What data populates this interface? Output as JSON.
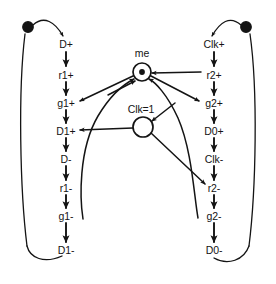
{
  "diagram": {
    "type": "signal-transition-graph",
    "title": "",
    "background_color": "#ffffff",
    "stroke_color": "#141414",
    "text_color": "#141414"
  },
  "places": [
    {
      "id": "me",
      "label": "me",
      "marked": true,
      "tokens": 1,
      "cx": 142,
      "cy": 72,
      "r": 9,
      "label_x": 142,
      "label_y": 53
    },
    {
      "id": "clk1",
      "label": "Clk=1",
      "marked": false,
      "tokens": 0,
      "cx": 143,
      "cy": 127,
      "r": 10,
      "label_x": 141,
      "label_y": 109
    },
    {
      "id": "p-left-init",
      "label": "",
      "marked": true,
      "tokens": 1,
      "cx": 28,
      "cy": 27,
      "r": 5.2,
      "label_x": 28,
      "label_y": 27
    },
    {
      "id": "p-right-init",
      "label": "",
      "marked": true,
      "tokens": 1,
      "cx": 246,
      "cy": 27,
      "r": 5.2,
      "label_x": 246,
      "label_y": 27
    }
  ],
  "transitions": {
    "left_column": [
      {
        "id": "d-plus",
        "label": "D+",
        "x": 66,
        "y": 44
      },
      {
        "id": "r1-plus",
        "label": "r1+",
        "x": 66,
        "y": 75
      },
      {
        "id": "g1-plus",
        "label": "g1+",
        "x": 66,
        "y": 103
      },
      {
        "id": "d1-plus",
        "label": "D1+",
        "x": 66,
        "y": 131
      },
      {
        "id": "d-minus",
        "label": "D-",
        "x": 66,
        "y": 159
      },
      {
        "id": "r1-minus",
        "label": "r1-",
        "x": 66,
        "y": 188
      },
      {
        "id": "g1-minus",
        "label": "g1-",
        "x": 66,
        "y": 216
      },
      {
        "id": "d1-minus",
        "label": "D1-",
        "x": 66,
        "y": 250
      }
    ],
    "right_column": [
      {
        "id": "clk-plus",
        "label": "Clk+",
        "x": 214,
        "y": 44
      },
      {
        "id": "r2-plus",
        "label": "r2+",
        "x": 214,
        "y": 75
      },
      {
        "id": "g2-plus",
        "label": "g2+",
        "x": 214,
        "y": 103
      },
      {
        "id": "d0-plus",
        "label": "D0+",
        "x": 214,
        "y": 131
      },
      {
        "id": "clk-minus",
        "label": "Clk-",
        "x": 214,
        "y": 159
      },
      {
        "id": "r2-minus",
        "label": "r2-",
        "x": 214,
        "y": 188
      },
      {
        "id": "g2-minus",
        "label": "g2-",
        "x": 214,
        "y": 216
      },
      {
        "id": "d0-minus",
        "label": "D0-",
        "x": 214,
        "y": 250
      }
    ]
  },
  "arcs": [
    {
      "id": "arc-init-l-to-dplus",
      "from": "p-left-init",
      "to": "d-plus"
    },
    {
      "id": "arc-dplus-r1plus",
      "from": "d-plus",
      "to": "r1-plus"
    },
    {
      "id": "arc-r1plus-g1plus",
      "from": "r1-plus",
      "to": "g1-plus"
    },
    {
      "id": "arc-g1plus-d1plus",
      "from": "g1-plus",
      "to": "d1-plus"
    },
    {
      "id": "arc-d1plus-dminus",
      "from": "d1-plus",
      "to": "d-minus"
    },
    {
      "id": "arc-dminus-r1minus",
      "from": "d-minus",
      "to": "r1-minus"
    },
    {
      "id": "arc-r1minus-g1minus",
      "from": "r1-minus",
      "to": "g1-minus"
    },
    {
      "id": "arc-g1minus-d1minus",
      "from": "g1-minus",
      "to": "d1-minus"
    },
    {
      "id": "arc-d1minus-init-l",
      "from": "d1-minus",
      "to": "p-left-init"
    },
    {
      "id": "arc-init-r-to-clkplus",
      "from": "p-right-init",
      "to": "clk-plus"
    },
    {
      "id": "arc-clkplus-r2plus",
      "from": "clk-plus",
      "to": "r2-plus"
    },
    {
      "id": "arc-r2plus-g2plus",
      "from": "r2-plus",
      "to": "g2-plus"
    },
    {
      "id": "arc-g2plus-d0plus",
      "from": "g2-plus",
      "to": "d0-plus"
    },
    {
      "id": "arc-d0plus-clkminus",
      "from": "d0-plus",
      "to": "clk-minus"
    },
    {
      "id": "arc-clkminus-r2minus",
      "from": "clk-minus",
      "to": "r2-minus"
    },
    {
      "id": "arc-r2minus-g2minus",
      "from": "r2-minus",
      "to": "g2-minus"
    },
    {
      "id": "arc-g2minus-d0minus",
      "from": "g2-minus",
      "to": "d0-minus"
    },
    {
      "id": "arc-d0minus-init-r",
      "from": "d0-minus",
      "to": "p-right-init"
    },
    {
      "id": "arc-me-g1plus",
      "from": "me",
      "to": "g1-plus"
    },
    {
      "id": "arc-me-g2plus",
      "from": "me",
      "to": "g2-plus"
    },
    {
      "id": "arc-r2plus-me",
      "from": "r2-plus",
      "to": "me"
    },
    {
      "id": "arc-g1minus-me",
      "from": "g1-minus",
      "to": "me"
    },
    {
      "id": "arc-g2minus-me",
      "from": "g2-minus",
      "to": "me"
    },
    {
      "id": "arc-clk1-d1plus",
      "from": "clk1",
      "to": "d1-plus"
    },
    {
      "id": "arc-clk1-r2minus",
      "from": "clk1",
      "to": "r2-minus"
    },
    {
      "id": "arc-clkplus-clk1",
      "from": "clk-plus",
      "to": "clk1"
    },
    {
      "id": "arc-clkminus-clk1",
      "from": "clk-minus",
      "to": "clk1"
    }
  ]
}
